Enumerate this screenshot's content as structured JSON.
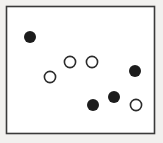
{
  "figure": {
    "width": 163,
    "height": 143,
    "background_color": "#f2f1ef",
    "plot_area": {
      "name": "bordered-rectangle",
      "x": 6.5,
      "y": 6.5,
      "width": 148,
      "height": 127,
      "fill_color": "#ffffff",
      "border_color": "#3a3a3a",
      "border_width": 1.6
    }
  },
  "chart_data": {
    "type": "scatter",
    "title": "",
    "xlabel": "",
    "ylabel": "",
    "xlim": [
      0,
      163
    ],
    "ylim": [
      0,
      143
    ],
    "grid": false,
    "legend": false,
    "axis_visible": false,
    "note": "Coordinates are in pixel space of the figure; y increases downward.",
    "series": [
      {
        "name": "filled",
        "marker": "filled-circle",
        "fill_color": "#1c1c1c",
        "edge_color": "#1c1c1c",
        "radius": 6.0,
        "count": 4,
        "points": [
          {
            "label": "filled-1",
            "x": 30,
            "y": 37
          },
          {
            "label": "filled-2",
            "x": 135,
            "y": 71
          },
          {
            "label": "filled-3",
            "x": 114,
            "y": 97
          },
          {
            "label": "filled-4",
            "x": 93,
            "y": 105
          }
        ]
      },
      {
        "name": "open",
        "marker": "open-circle",
        "fill_color": "#ffffff",
        "edge_color": "#2b2b2b",
        "edge_width": 1.6,
        "radius": 5.6,
        "count": 4,
        "points": [
          {
            "label": "open-1",
            "x": 70,
            "y": 62
          },
          {
            "label": "open-2",
            "x": 92,
            "y": 62
          },
          {
            "label": "open-3",
            "x": 50,
            "y": 77
          },
          {
            "label": "open-4",
            "x": 136,
            "y": 105
          }
        ]
      }
    ]
  }
}
